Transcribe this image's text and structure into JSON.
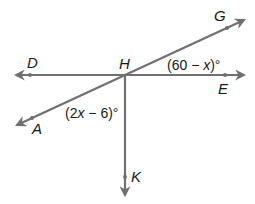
{
  "diagram": {
    "type": "geometry-lines-and-angles",
    "colors": {
      "line": "#707070",
      "text": "#1a1a1a",
      "background": "#ffffff"
    },
    "points": {
      "D": {
        "label": "D"
      },
      "H": {
        "label": "H"
      },
      "G": {
        "label": "G"
      },
      "E": {
        "label": "E"
      },
      "A": {
        "label": "A"
      },
      "K": {
        "label": "K"
      }
    },
    "lines": [
      {
        "name": "line-DE",
        "through": [
          "D",
          "H",
          "E"
        ],
        "kind": "line"
      },
      {
        "name": "line-AG",
        "through": [
          "A",
          "H",
          "G"
        ],
        "kind": "line"
      },
      {
        "name": "ray-HK",
        "through": [
          "H",
          "K"
        ],
        "kind": "ray"
      }
    ],
    "angles": {
      "GHE": {
        "label_parts": [
          "(60 ",
          "−",
          " ",
          "x",
          ")°"
        ],
        "text": "(60 − x)°"
      },
      "AHK": {
        "label_parts": [
          "(2",
          "x",
          " ",
          "−",
          " 6)°"
        ],
        "text": "(2x − 6)°"
      }
    }
  }
}
